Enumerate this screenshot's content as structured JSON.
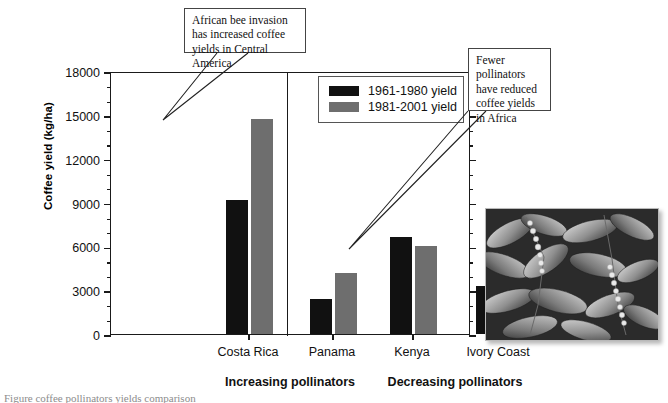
{
  "chart_data": {
    "type": "bar",
    "title": "",
    "xlabel": "",
    "ylabel": "Coffee yield (kg/ha)",
    "ylim": [
      0,
      18000
    ],
    "ytick_labels": [
      "0",
      "3000",
      "6000",
      "9000",
      "12000",
      "15000",
      "18000"
    ],
    "ytick_values": [
      0,
      3000,
      6000,
      9000,
      12000,
      15000,
      18000
    ],
    "minor_tick_interval": 1000,
    "grid": false,
    "legend_position": "top-right-inside",
    "categories": [
      "Costa Rica",
      "Panama",
      "Kenya",
      "Ivory Coast"
    ],
    "series": [
      {
        "name": "1961-1980 yield",
        "color": "#111111",
        "values": [
          9200,
          2400,
          6650,
          3300
        ]
      },
      {
        "name": "1981-2001 yield",
        "color": "#6e6e6e",
        "values": [
          14700,
          4150,
          6000,
          2400
        ]
      }
    ],
    "groups": [
      {
        "label": "Increasing pollinators",
        "categories": [
          "Costa Rica",
          "Panama"
        ]
      },
      {
        "label": "Decreasing pollinators",
        "categories": [
          "Kenya",
          "Ivory Coast"
        ]
      }
    ],
    "annotations": [
      {
        "id": "callout-1",
        "text": "African bee invasion has increased coffee yields in Central America",
        "points_to": "Costa Rica 1981-2001 yield"
      },
      {
        "id": "callout-2",
        "text": "Fewer pollinators have reduced coffee yields in Africa",
        "points_to": "Kenya 1981-2001 yield"
      }
    ]
  },
  "legend": {
    "items": [
      {
        "label": "1961-1980 yield",
        "color": "#111111"
      },
      {
        "label": "1981-2001 yield",
        "color": "#6e6e6e"
      }
    ]
  },
  "photo": {
    "caption": "",
    "alt_name": "coffee-plant-photo"
  },
  "caption_sliver": {
    "text": "Figure   coffee  pollinators  yields  comparison"
  }
}
